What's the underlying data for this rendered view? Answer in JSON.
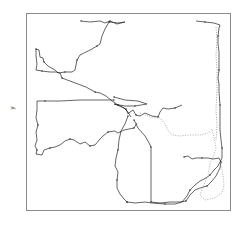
{
  "chart_data": {
    "type": "line",
    "title": "",
    "xlabel": "",
    "ylabel": "y",
    "grid": false,
    "legend": null,
    "frame": {
      "left": 26,
      "top": 13,
      "right": 230,
      "bottom": 210
    },
    "frame_color": "#8a8a8a",
    "series": [
      {
        "name": "track-north",
        "color": "#222222",
        "style": "solid",
        "points": [
          [
            81,
            21
          ],
          [
            90,
            22
          ],
          [
            100,
            21
          ],
          [
            105,
            23
          ],
          [
            110,
            21
          ],
          [
            117,
            24
          ],
          [
            125,
            22
          ],
          [
            118,
            23
          ],
          [
            109,
            22
          ],
          [
            105,
            29
          ],
          [
            102,
            36
          ],
          [
            100,
            44
          ],
          [
            97,
            46
          ],
          [
            92,
            49
          ],
          [
            88,
            51
          ],
          [
            80,
            55
          ],
          [
            77,
            60
          ],
          [
            76,
            65
          ],
          [
            75,
            70
          ],
          [
            72,
            72
          ],
          [
            65,
            72
          ],
          [
            58,
            73
          ],
          [
            55,
            70
          ],
          [
            48,
            66
          ],
          [
            44,
            62
          ],
          [
            43,
            58
          ],
          [
            40,
            57
          ],
          [
            39,
            50
          ],
          [
            36,
            49
          ],
          [
            36,
            56
          ],
          [
            37,
            64
          ],
          [
            36,
            70
          ],
          [
            42,
            71
          ],
          [
            50,
            72
          ],
          [
            56,
            72
          ],
          [
            60,
            73
          ],
          [
            62,
            78
          ],
          [
            70,
            81
          ],
          [
            78,
            84
          ],
          [
            86,
            87
          ],
          [
            95,
            92
          ],
          [
            100,
            93
          ],
          [
            106,
            96
          ],
          [
            112,
            101
          ],
          [
            118,
            105
          ],
          [
            124,
            108
          ],
          [
            128,
            112
          ],
          [
            131,
            117
          ]
        ]
      },
      {
        "name": "track-west-loop",
        "color": "#222222",
        "style": "solid",
        "points": [
          [
            114,
            100
          ],
          [
            100,
            100
          ],
          [
            80,
            100
          ],
          [
            60,
            101
          ],
          [
            45,
            101
          ],
          [
            37,
            101
          ],
          [
            37,
            110
          ],
          [
            36,
            118
          ],
          [
            38,
            125
          ],
          [
            36,
            132
          ],
          [
            37,
            140
          ],
          [
            35,
            146
          ],
          [
            37,
            150
          ],
          [
            36,
            154
          ],
          [
            42,
            155
          ],
          [
            44,
            150
          ],
          [
            50,
            148
          ],
          [
            55,
            147
          ],
          [
            60,
            145
          ],
          [
            65,
            141
          ],
          [
            70,
            139
          ],
          [
            74,
            140
          ],
          [
            80,
            144
          ],
          [
            85,
            142
          ],
          [
            90,
            146
          ],
          [
            95,
            145
          ],
          [
            100,
            139
          ],
          [
            103,
            136
          ],
          [
            108,
            132
          ],
          [
            115,
            131
          ],
          [
            118,
            133
          ],
          [
            124,
            130
          ],
          [
            134,
            128
          ],
          [
            137,
            123
          ]
        ]
      },
      {
        "name": "track-river",
        "color": "#222222",
        "style": "solid",
        "points": [
          [
            114,
            97
          ],
          [
            125,
            100
          ],
          [
            138,
            101
          ],
          [
            147,
            104
          ],
          [
            135,
            106
          ],
          [
            125,
            106
          ],
          [
            114,
            104
          ],
          [
            120,
            106
          ],
          [
            126,
            109
          ],
          [
            128,
            114
          ],
          [
            130,
            112
          ],
          [
            133,
            110
          ],
          [
            136,
            115
          ],
          [
            140,
            116
          ],
          [
            145,
            113
          ],
          [
            152,
            116
          ],
          [
            158,
            117
          ],
          [
            160,
            112
          ],
          [
            163,
            108
          ],
          [
            168,
            109
          ],
          [
            175,
            108
          ],
          [
            182,
            105
          ]
        ]
      },
      {
        "name": "track-south-west",
        "color": "#222222",
        "style": "solid",
        "points": [
          [
            128,
            116
          ],
          [
            125,
            124
          ],
          [
            121,
            131
          ],
          [
            119,
            140
          ],
          [
            118,
            150
          ],
          [
            116,
            158
          ],
          [
            115,
            166
          ],
          [
            118,
            172
          ],
          [
            117,
            180
          ],
          [
            117,
            188
          ],
          [
            120,
            194
          ],
          [
            124,
            199
          ],
          [
            127,
            202
          ]
        ]
      },
      {
        "name": "track-south-central",
        "color": "#222222",
        "style": "solid",
        "points": [
          [
            134,
            120
          ],
          [
            138,
            128
          ],
          [
            145,
            136
          ],
          [
            148,
            141
          ],
          [
            151,
            147
          ],
          [
            151,
            160
          ],
          [
            151,
            175
          ],
          [
            151,
            190
          ],
          [
            151,
            202
          ],
          [
            160,
            203
          ],
          [
            170,
            202
          ],
          [
            180,
            202
          ],
          [
            186,
            201
          ],
          [
            190,
            195
          ],
          [
            195,
            190
          ],
          [
            200,
            188
          ],
          [
            207,
            186
          ],
          [
            212,
            181
          ],
          [
            216,
            176
          ],
          [
            220,
            168
          ],
          [
            221,
            162
          ],
          [
            219,
            158
          ],
          [
            213,
            159
          ],
          [
            208,
            158
          ],
          [
            202,
            158
          ],
          [
            196,
            158
          ],
          [
            192,
            159
          ],
          [
            188,
            156
          ],
          [
            184,
            157
          ]
        ]
      },
      {
        "name": "track-south-east",
        "color": "#222222",
        "style": "solid",
        "points": [
          [
            127,
            202
          ],
          [
            135,
            203
          ],
          [
            145,
            202
          ],
          [
            152,
            203
          ],
          [
            165,
            204
          ],
          [
            175,
            204
          ],
          [
            182,
            202
          ],
          [
            187,
            196
          ],
          [
            190,
            190
          ],
          [
            195,
            185
          ],
          [
            200,
            181
          ],
          [
            206,
            178
          ],
          [
            210,
            175
          ],
          [
            214,
            170
          ],
          [
            218,
            166
          ],
          [
            222,
            158
          ],
          [
            222,
            148
          ],
          [
            221,
            140
          ],
          [
            220,
            130
          ],
          [
            220,
            118
          ],
          [
            220,
            105
          ],
          [
            219,
            92
          ],
          [
            219,
            84
          ],
          [
            218,
            78
          ],
          [
            219,
            70
          ],
          [
            219,
            62
          ],
          [
            219,
            52
          ],
          [
            218,
            44
          ],
          [
            218,
            36
          ],
          [
            219,
            28
          ],
          [
            220,
            25
          ],
          [
            214,
            23
          ],
          [
            205,
            22
          ],
          [
            196,
            21
          ]
        ]
      },
      {
        "name": "track-east-dotted",
        "color": "#999999",
        "style": "dotted",
        "points": [
          [
            140,
            113
          ],
          [
            150,
            117
          ],
          [
            160,
            118
          ],
          [
            165,
            124
          ],
          [
            168,
            130
          ],
          [
            172,
            135
          ],
          [
            180,
            136
          ],
          [
            190,
            135
          ],
          [
            200,
            135
          ],
          [
            208,
            133
          ],
          [
            212,
            129
          ],
          [
            214,
            138
          ],
          [
            216,
            148
          ],
          [
            214,
            155
          ],
          [
            210,
            164
          ],
          [
            208,
            175
          ],
          [
            204,
            185
          ],
          [
            200,
            195
          ],
          [
            205,
            200
          ],
          [
            215,
            198
          ],
          [
            222,
            193
          ],
          [
            224,
            185
          ],
          [
            223,
            175
          ],
          [
            221,
            165
          ]
        ]
      },
      {
        "name": "track-east-edge-dotted",
        "color": "#888888",
        "style": "dotted",
        "points": [
          [
            216,
            27
          ],
          [
            217,
            40
          ],
          [
            216,
            55
          ],
          [
            217,
            70
          ],
          [
            217,
            90
          ],
          [
            216,
            110
          ],
          [
            217,
            125
          ],
          [
            216,
            140
          ]
        ]
      }
    ]
  }
}
